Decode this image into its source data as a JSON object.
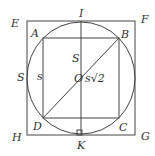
{
  "diagram": {
    "type": "geometry",
    "colors": {
      "stroke": "#444444",
      "text": "#333333",
      "background": "#ffffff"
    },
    "points": {
      "E": "E",
      "F": "F",
      "G": "G",
      "H": "H",
      "A": "A",
      "B": "B",
      "C": "C",
      "D": "D",
      "I": "I",
      "K": "K",
      "O": "O"
    },
    "labels": {
      "outer_side": "S",
      "inner_side": "s",
      "half_side_upper": "S",
      "diagonal": "s√2"
    }
  }
}
